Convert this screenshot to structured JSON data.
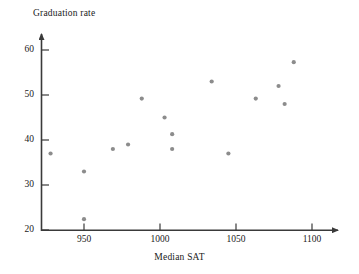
{
  "chart_data": {
    "type": "scatter",
    "title": "",
    "xlabel": "Median SAT",
    "ylabel": "Graduation rate",
    "xlim": [
      925,
      1112
    ],
    "ylim": [
      19,
      64
    ],
    "xticks": [
      950,
      1000,
      1050,
      1100
    ],
    "yticks": [
      20,
      30,
      40,
      50,
      60
    ],
    "grid": false,
    "legend": null,
    "marker_color": "#8c8c8c",
    "axis_color": "#3a3a3a",
    "series": [
      {
        "name": "Colleges",
        "points": [
          {
            "x": 928,
            "y": 37
          },
          {
            "x": 950,
            "y": 33
          },
          {
            "x": 950,
            "y": 22.4
          },
          {
            "x": 969,
            "y": 38
          },
          {
            "x": 979,
            "y": 39
          },
          {
            "x": 988,
            "y": 49.2
          },
          {
            "x": 1003,
            "y": 45
          },
          {
            "x": 1008,
            "y": 41.3
          },
          {
            "x": 1008,
            "y": 38
          },
          {
            "x": 1034,
            "y": 53
          },
          {
            "x": 1045,
            "y": 37
          },
          {
            "x": 1063,
            "y": 49.2
          },
          {
            "x": 1078,
            "y": 52
          },
          {
            "x": 1082,
            "y": 48
          },
          {
            "x": 1088,
            "y": 57.3
          }
        ]
      }
    ]
  },
  "axes": {
    "y_title": "Graduation rate",
    "x_title": "Median SAT",
    "y_tick_labels": [
      "20",
      "30",
      "40",
      "50",
      "60"
    ],
    "x_tick_labels": [
      "950",
      "1000",
      "1050",
      "1100"
    ]
  }
}
